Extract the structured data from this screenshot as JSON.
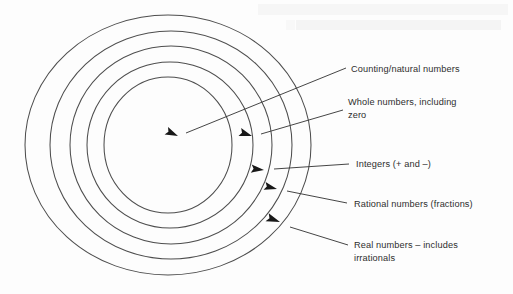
{
  "figure": {
    "background_color": "#fdfdfd",
    "line_color": "#4e4e4e",
    "text_color": "#2e2e2e",
    "arrow_color": "#181818"
  },
  "rings": [
    {
      "index": 1,
      "name": "counting-natural-numbers",
      "label": "Counting/natural numbers",
      "cx": 168,
      "cy": 145,
      "rx": 64,
      "ry": 68
    },
    {
      "index": 2,
      "name": "whole-numbers",
      "label_line1": "Whole numbers, including",
      "label_line2": "zero",
      "cx": 170,
      "cy": 145,
      "rx": 83,
      "ry": 83
    },
    {
      "index": 3,
      "name": "integers",
      "label": "Integers (+ and –)",
      "cx": 171,
      "cy": 145,
      "rx": 101,
      "ry": 99
    },
    {
      "index": 4,
      "name": "rational-numbers",
      "label": "Rational numbers (fractions)",
      "cx": 171,
      "cy": 145,
      "rx": 121,
      "ry": 114
    },
    {
      "index": 5,
      "name": "real-numbers",
      "label_line1": "Real numbers – includes",
      "label_line2": "irrationals",
      "cx": 168,
      "cy": 145,
      "rx": 143,
      "ry": 130
    }
  ],
  "callouts": [
    {
      "name": "callout-counting-natural-numbers",
      "text": "Counting/natural numbers",
      "text_x": 351,
      "text_y": 72,
      "line_x1": 346,
      "line_y1": 68,
      "line_x2": 184,
      "line_y2": 134,
      "arrow_x": 178,
      "arrow_y": 136,
      "arrow_angle": 202
    },
    {
      "name": "callout-whole-numbers",
      "text_line1": "Whole numbers, including",
      "text_line2": "zero",
      "text_x": 348,
      "text_y": 105,
      "text2_x": 348,
      "text2_y": 118,
      "line_x1": 343,
      "line_y1": 110,
      "line_x2": 260,
      "line_y2": 134,
      "arrow_x": 252,
      "arrow_y": 136,
      "arrow_angle": 196
    },
    {
      "name": "callout-integers",
      "text": "Integers (+ and –)",
      "text_x": 356,
      "text_y": 167,
      "line_x1": 349,
      "line_y1": 164,
      "line_x2": 273,
      "line_y2": 169,
      "arrow_x": 264,
      "arrow_y": 170,
      "arrow_angle": 184
    },
    {
      "name": "callout-rational-numbers",
      "text": "Rational numbers (fractions)",
      "text_x": 354,
      "text_y": 207,
      "line_x1": 347,
      "line_y1": 203,
      "line_x2": 286,
      "line_y2": 191,
      "arrow_x": 277,
      "arrow_y": 189,
      "arrow_angle": 192
    },
    {
      "name": "callout-real-numbers",
      "text_line1": "Real numbers – includes",
      "text_line2": "irrationals",
      "text_x": 354,
      "text_y": 248,
      "text2_x": 354,
      "text2_y": 261,
      "line_x1": 348,
      "line_y1": 245,
      "line_x2": 289,
      "line_y2": 226,
      "arrow_x": 280,
      "arrow_y": 222,
      "arrow_angle": 198
    }
  ],
  "artifacts": {
    "note": "faint scanner bleed-through text at top, illegible",
    "ghost_top": " ",
    "ghost_bottom": " "
  }
}
